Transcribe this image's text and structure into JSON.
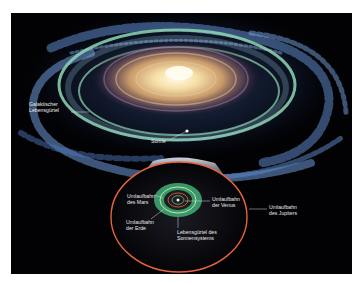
{
  "diagram": {
    "title": "",
    "colors": {
      "background": "#020204",
      "galactic_habitable_zone": "#8fd7b4",
      "solar_habitable_zone": "#3fae7a",
      "jupiter_orbit": "#e8643c",
      "mars_orbit": "#c8503c",
      "earth_orbit": "#d8f0a0",
      "venus_orbit": "#c0c0c0",
      "galaxy_core": "#fff2c8",
      "spiral_arms": "#6f9ad8"
    },
    "galaxy_labels": {
      "galactic_zone_line1": "Galaktischer",
      "galactic_zone_line2": "Lebensgürtel",
      "sun": "Sonne"
    },
    "solar_system_labels": {
      "mars_line1": "Umlaufbahn",
      "mars_line2": "des Mars",
      "venus_line1": "Umlaufbahn",
      "venus_line2": "der Venus",
      "jupiter_line1": "Umlaufbahn",
      "jupiter_line2": "des Jupiters",
      "earth_line1": "Umlaufbahn",
      "earth_line2": "der Erde",
      "habitable_line1": "Lebensgürtel des",
      "habitable_line2": "Sonnensystems"
    }
  }
}
